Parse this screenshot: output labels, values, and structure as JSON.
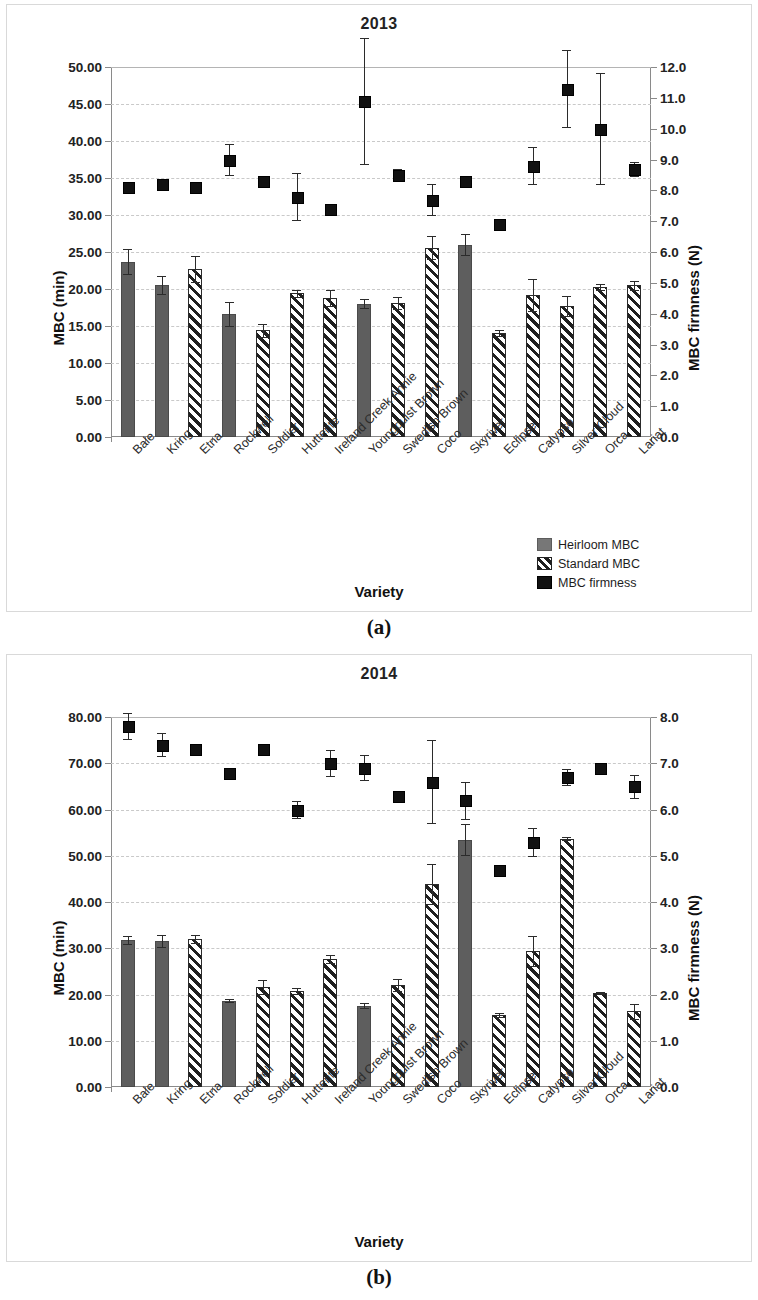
{
  "figure": {
    "caption_a": "(a)",
    "caption_b": "(b)"
  },
  "panel_a": {
    "title": "2013",
    "ylabel_left": "MBC (min)",
    "ylabel_right": "MBC firmness (N)",
    "xlabel": "Variety",
    "legend": [
      {
        "key": "heirloom",
        "label": "Heirloom MBC",
        "style": "solid"
      },
      {
        "key": "standard",
        "label": "Standard MBC",
        "style": "hatch"
      },
      {
        "key": "firmness",
        "label": "MBC firmness",
        "style": "point"
      }
    ]
  },
  "panel_b": {
    "title": "2014",
    "ylabel_left": "MBC (min)",
    "ylabel_right": "MBC firmness (N)",
    "xlabel": "Variety"
  },
  "chart_data": [
    {
      "type": "bar",
      "title": "2013",
      "xlabel": "Variety",
      "ylabel": "MBC (min)",
      "ylabel_right": "MBC firmness (N)",
      "ylim": [
        0,
        50
      ],
      "yticks": [
        "0.00",
        "5.00",
        "10.00",
        "15.00",
        "20.00",
        "25.00",
        "30.00",
        "35.00",
        "40.00",
        "45.00",
        "50.00"
      ],
      "ylim_right": [
        0,
        12
      ],
      "yticks_right": [
        "0.0",
        "1.0",
        "2.0",
        "3.0",
        "4.0",
        "5.0",
        "6.0",
        "7.0",
        "8.0",
        "9.0",
        "10.0",
        "11.0",
        "12.0"
      ],
      "grid": true,
      "legend_position": "bottom-right",
      "categories": [
        "Bale",
        "Kring",
        "Etna",
        "Rockwell",
        "Soldier",
        "Hutterite",
        "Ireland Creek Annie",
        "Youngquist Brown",
        "Swedish Brown",
        "Coco",
        "Skyriver",
        "Eclipse",
        "Calypso",
        "Silver Cloud",
        "Orca",
        "Lariat"
      ],
      "series": [
        {
          "name": "Heirloom MBC",
          "style": "solid",
          "axis": "left",
          "values": [
            23.7,
            20.5,
            null,
            16.6,
            null,
            null,
            null,
            18.0,
            null,
            null,
            26.0,
            null,
            null,
            null,
            null,
            null
          ],
          "errors": [
            1.7,
            1.2,
            null,
            1.6,
            null,
            null,
            null,
            0.6,
            null,
            null,
            1.4,
            null,
            null,
            null,
            null,
            null
          ]
        },
        {
          "name": "Standard MBC",
          "style": "hatch",
          "axis": "left",
          "values": [
            null,
            null,
            22.7,
            null,
            14.4,
            19.4,
            18.8,
            null,
            18.1,
            25.6,
            null,
            14.0,
            19.2,
            17.7,
            20.3,
            20.5
          ],
          "errors": [
            null,
            null,
            1.7,
            null,
            0.9,
            0.5,
            1.1,
            null,
            0.8,
            1.5,
            null,
            0.4,
            2.2,
            1.3,
            0.4,
            0.6
          ]
        },
        {
          "name": "MBC firmness",
          "style": "point",
          "axis": "right",
          "values": [
            8.1,
            8.2,
            8.1,
            9.0,
            8.3,
            7.8,
            7.4,
            10.9,
            8.5,
            7.7,
            8.3,
            6.9,
            8.8,
            11.3,
            10.0,
            8.7
          ],
          "errors": [
            0.15,
            0.1,
            0.15,
            0.5,
            0.12,
            0.75,
            0.1,
            2.05,
            0.2,
            0.5,
            0.18,
            0.12,
            0.6,
            1.25,
            1.8,
            0.22
          ]
        }
      ]
    },
    {
      "type": "bar",
      "title": "2014",
      "xlabel": "Variety",
      "ylabel": "MBC (min)",
      "ylabel_right": "MBC firmness (N)",
      "ylim": [
        0,
        80
      ],
      "yticks": [
        "0.00",
        "10.00",
        "20.00",
        "30.00",
        "40.00",
        "50.00",
        "60.00",
        "70.00",
        "80.00"
      ],
      "ylim_right": [
        0,
        8
      ],
      "yticks_right": [
        "0.0",
        "1.0",
        "2.0",
        "3.0",
        "4.0",
        "5.0",
        "6.0",
        "7.0",
        "8.0"
      ],
      "grid": true,
      "legend_position": "none",
      "categories": [
        "Bale",
        "Kring",
        "Etna",
        "Rockwell",
        "Soldier",
        "Hutterite",
        "Ireland Creek Annie",
        "Youngquist Brown",
        "Swedish Brown",
        "Coco",
        "Skyriver",
        "Eclipse",
        "Calypso",
        "Silver Cloud",
        "Orca",
        "Lariat"
      ],
      "series": [
        {
          "name": "Heirloom MBC",
          "style": "solid",
          "axis": "left",
          "values": [
            31.8,
            31.5,
            null,
            18.7,
            null,
            null,
            null,
            17.6,
            null,
            null,
            53.5,
            null,
            null,
            null,
            null,
            null
          ],
          "errors": [
            0.9,
            1.3,
            null,
            0.4,
            null,
            null,
            null,
            0.5,
            null,
            null,
            3.3,
            null,
            null,
            null,
            null,
            null
          ]
        },
        {
          "name": "Standard MBC",
          "style": "hatch",
          "axis": "left",
          "values": [
            null,
            null,
            32.0,
            null,
            21.6,
            20.8,
            27.7,
            null,
            22.0,
            43.9,
            null,
            15.6,
            29.4,
            53.7,
            20.3,
            16.4
          ],
          "errors": [
            null,
            null,
            0.8,
            null,
            1.5,
            0.7,
            0.8,
            null,
            1.3,
            4.4,
            null,
            0.5,
            3.2,
            0.3,
            0.2,
            1.6
          ]
        },
        {
          "name": "MBC firmness",
          "style": "point",
          "axis": "right",
          "values": [
            7.8,
            7.4,
            7.3,
            6.8,
            7.3,
            6.0,
            7.0,
            6.9,
            6.3,
            6.6,
            6.2,
            4.7,
            5.3,
            6.7,
            6.9,
            6.5
          ],
          "errors": [
            0.28,
            0.25,
            0.07,
            0.07,
            0.07,
            0.18,
            0.28,
            0.27,
            0.1,
            0.9,
            0.4,
            0.06,
            0.3,
            0.18,
            0.1,
            0.25
          ]
        }
      ]
    }
  ]
}
